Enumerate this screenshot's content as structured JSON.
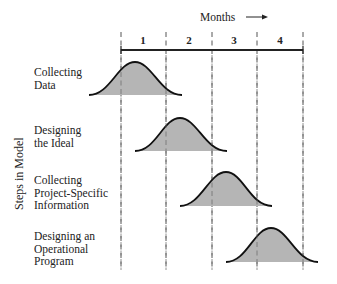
{
  "diagram": {
    "x_axis_title": "Months",
    "x_axis_arrow": "arrow-right",
    "y_axis_title": "Steps in Model",
    "months": [
      "1",
      "2",
      "3",
      "4"
    ],
    "steps": [
      {
        "lines": [
          "Collecting",
          "Data"
        ],
        "start_month": 0.5,
        "peak_month": 1.0,
        "end_month": 2.0
      },
      {
        "lines": [
          "Designing",
          "the Ideal"
        ],
        "start_month": 1.3,
        "peak_month": 1.8,
        "end_month": 2.3
      },
      {
        "lines": [
          "Collecting",
          "Project-Specific",
          "Information"
        ],
        "start_month": 2.3,
        "peak_month": 2.8,
        "end_month": 3.3
      },
      {
        "lines": [
          "Designing an",
          "Operational",
          "Program"
        ],
        "start_month": 3.3,
        "peak_month": 3.8,
        "end_month": 4.3
      }
    ],
    "colors": {
      "curve_fill": "#b5b5b5",
      "curve_stroke": "#111111",
      "dashed_line": "#555555",
      "axis_line": "#222222"
    }
  }
}
